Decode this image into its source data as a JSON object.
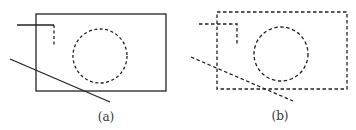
{
  "panels": [
    {
      "label": "(a)",
      "description": "Rectangle with solid outline, dashed hidden circle, polyline with dashed end, solid diagonal line"
    },
    {
      "label": "(b)",
      "description": "All edges dashed: rectangle, circle, polyline, diagonal line"
    }
  ],
  "colors": {
    "stroke": "#222222",
    "background": "#ffffff"
  }
}
